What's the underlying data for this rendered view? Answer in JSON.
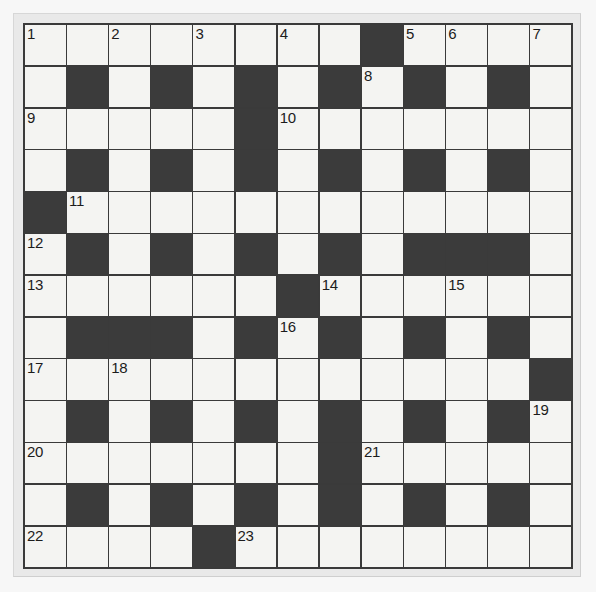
{
  "puzzle": {
    "title": "Crossword Grid",
    "rows": 13,
    "columns": 13,
    "colors": {
      "page_background": "#f7f7f7",
      "frame": "#e9e9e9",
      "grid_line": "#3a3a3a",
      "white_cell": "#f4f4f2",
      "black_cell": "#3b3b3b",
      "number_text": "#1c1c1c"
    },
    "legend": {
      "white": 0,
      "black": 1
    },
    "grid": [
      [
        0,
        0,
        0,
        0,
        0,
        0,
        0,
        0,
        1,
        0,
        0,
        0,
        0
      ],
      [
        0,
        1,
        0,
        1,
        0,
        1,
        0,
        1,
        0,
        1,
        0,
        1,
        0
      ],
      [
        0,
        0,
        0,
        0,
        0,
        1,
        0,
        0,
        0,
        0,
        0,
        0,
        0
      ],
      [
        0,
        1,
        0,
        1,
        0,
        1,
        0,
        1,
        0,
        1,
        0,
        1,
        0
      ],
      [
        1,
        0,
        0,
        0,
        0,
        0,
        0,
        0,
        0,
        0,
        0,
        0,
        0
      ],
      [
        0,
        1,
        0,
        1,
        0,
        1,
        0,
        1,
        0,
        1,
        1,
        1,
        0
      ],
      [
        0,
        0,
        0,
        0,
        0,
        0,
        1,
        0,
        0,
        0,
        0,
        0,
        0
      ],
      [
        0,
        1,
        1,
        1,
        0,
        1,
        0,
        1,
        0,
        1,
        0,
        1,
        0
      ],
      [
        0,
        0,
        0,
        0,
        0,
        0,
        0,
        0,
        0,
        0,
        0,
        0,
        1
      ],
      [
        0,
        1,
        0,
        1,
        0,
        1,
        0,
        1,
        0,
        1,
        0,
        1,
        0
      ],
      [
        0,
        0,
        0,
        0,
        0,
        0,
        0,
        1,
        0,
        0,
        0,
        0,
        0
      ],
      [
        0,
        1,
        0,
        1,
        0,
        1,
        0,
        1,
        0,
        1,
        0,
        1,
        0
      ],
      [
        0,
        0,
        0,
        0,
        1,
        0,
        0,
        0,
        0,
        0,
        0,
        0,
        0
      ]
    ],
    "numbers": [
      {
        "n": "1",
        "row": 0,
        "col": 0
      },
      {
        "n": "2",
        "row": 0,
        "col": 2
      },
      {
        "n": "3",
        "row": 0,
        "col": 4
      },
      {
        "n": "4",
        "row": 0,
        "col": 6
      },
      {
        "n": "5",
        "row": 0,
        "col": 9
      },
      {
        "n": "6",
        "row": 0,
        "col": 10
      },
      {
        "n": "7",
        "row": 0,
        "col": 12
      },
      {
        "n": "8",
        "row": 1,
        "col": 8
      },
      {
        "n": "9",
        "row": 2,
        "col": 0
      },
      {
        "n": "10",
        "row": 2,
        "col": 6
      },
      {
        "n": "11",
        "row": 4,
        "col": 1
      },
      {
        "n": "12",
        "row": 5,
        "col": 0
      },
      {
        "n": "13",
        "row": 6,
        "col": 0
      },
      {
        "n": "14",
        "row": 6,
        "col": 7
      },
      {
        "n": "15",
        "row": 6,
        "col": 10
      },
      {
        "n": "16",
        "row": 7,
        "col": 6
      },
      {
        "n": "17",
        "row": 8,
        "col": 0
      },
      {
        "n": "18",
        "row": 8,
        "col": 2
      },
      {
        "n": "19",
        "row": 9,
        "col": 12
      },
      {
        "n": "20",
        "row": 10,
        "col": 0
      },
      {
        "n": "21",
        "row": 10,
        "col": 8
      },
      {
        "n": "22",
        "row": 12,
        "col": 0
      },
      {
        "n": "23",
        "row": 12,
        "col": 5
      }
    ],
    "letters": []
  }
}
